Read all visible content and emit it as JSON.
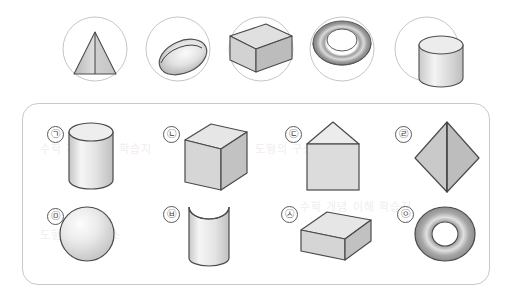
{
  "page": {
    "background_color": "#ffffff",
    "panel_border_color": "#c9c9c9",
    "outline_color": "#4a4a4a",
    "fill_light": "#f2f2f2",
    "fill_mid": "#d8d8d8",
    "fill_dark": "#b8b8b8"
  },
  "top_row": {
    "label": "cross-section views",
    "items": [
      {
        "id": "top-1",
        "shape_name": "cone-partial-view",
        "alt": "circle containing a shaded cone seen from the side with vertical axis line"
      },
      {
        "id": "top-2",
        "shape_name": "sphere-partial-view",
        "alt": "circle containing a shaded ellipsoid/sphere segment"
      },
      {
        "id": "top-3",
        "shape_name": "rectangular-prism-partial-view",
        "alt": "circle containing a shaded rectangular prism"
      },
      {
        "id": "top-4",
        "shape_name": "torus-partial-view",
        "alt": "circle containing the upper arc band of a torus"
      },
      {
        "id": "top-5",
        "shape_name": "cylinder-partial-view",
        "alt": "circle containing a shaded cylinder segment"
      }
    ]
  },
  "panel": {
    "label": "solids-answer-panel",
    "shapes": [
      {
        "tag": "㉠",
        "tag_plain": "g",
        "name": "cylinder",
        "row": 1,
        "col": 1
      },
      {
        "tag": "㉡",
        "tag_plain": "n",
        "name": "cube",
        "row": 1,
        "col": 2
      },
      {
        "tag": "㉢",
        "tag_plain": "d",
        "name": "house-prism",
        "row": 1,
        "col": 3
      },
      {
        "tag": "㉣",
        "tag_plain": "r",
        "name": "octahedron",
        "row": 1,
        "col": 4
      },
      {
        "tag": "㉤",
        "tag_plain": "m",
        "name": "sphere",
        "row": 2,
        "col": 1
      },
      {
        "tag": "㉥",
        "tag_plain": "b",
        "name": "cylinder-concave-top",
        "row": 2,
        "col": 2
      },
      {
        "tag": "㉦",
        "tag_plain": "s",
        "name": "rectangular-prism",
        "row": 2,
        "col": 3
      },
      {
        "tag": "㉧",
        "tag_plain": "o",
        "name": "torus",
        "row": 2,
        "col": 4
      }
    ]
  },
  "watermark": {
    "line1": "수학 개념 이해 학습지",
    "line2": "도형의 구성요소"
  }
}
